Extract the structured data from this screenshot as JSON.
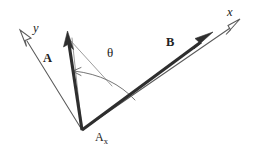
{
  "figure": {
    "background_color": "#ffffff",
    "ink_color": "#2e2e2e",
    "axis_color": "#5a5a5a",
    "thin_color": "#8a8a8a",
    "arc_color": "#6e6e6e",
    "width": 258,
    "height": 151
  },
  "labels": {
    "y_axis": "y",
    "x_axis": "x",
    "vector_a": "A",
    "vector_b": "B",
    "angle": "θ",
    "component_base": "A",
    "component_sub": "x"
  },
  "geometry": {
    "origin": {
      "x": 82,
      "y": 130
    },
    "y_axis_tip": {
      "x": 22,
      "y": 33
    },
    "x_axis_tip": {
      "x": 240,
      "y": 20
    },
    "vector_a_tip": {
      "x": 68,
      "y": 35
    },
    "vector_b_tip": {
      "x": 212,
      "y": 33
    },
    "arc_start": {
      "x": 135,
      "y": 100
    },
    "arc_end": {
      "x": 73,
      "y": 72
    }
  }
}
